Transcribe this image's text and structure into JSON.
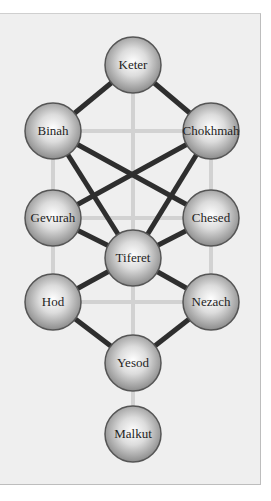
{
  "colors": {
    "panel_bg": "#efefef",
    "light_path": "#d2d2d2",
    "dark_path": "#2e2e2e",
    "node_outline": "#555555"
  },
  "nodes": [
    {
      "id": "keter",
      "label": "Keter",
      "x": 133,
      "y": 65
    },
    {
      "id": "binah",
      "label": "Binah",
      "x": 53,
      "y": 131
    },
    {
      "id": "chokhmah",
      "label": "Chokhmah",
      "x": 211,
      "y": 131
    },
    {
      "id": "gevurah",
      "label": "Gevurah",
      "x": 53,
      "y": 218
    },
    {
      "id": "chesed",
      "label": "Chesed",
      "x": 211,
      "y": 218
    },
    {
      "id": "tiferet",
      "label": "Tiferet",
      "x": 133,
      "y": 258
    },
    {
      "id": "hod",
      "label": "Hod",
      "x": 53,
      "y": 302
    },
    {
      "id": "nezach",
      "label": "Nezach",
      "x": 211,
      "y": 302
    },
    {
      "id": "yesod",
      "label": "Yesod",
      "x": 133,
      "y": 363
    },
    {
      "id": "malkut",
      "label": "Malkut",
      "x": 133,
      "y": 434
    }
  ],
  "light_paths": [
    [
      "keter",
      "yesod"
    ],
    [
      "yesod",
      "malkut"
    ],
    [
      "binah",
      "hod"
    ],
    [
      "chokhmah",
      "nezach"
    ],
    [
      "binah",
      "chokhmah"
    ],
    [
      "gevurah",
      "chesed"
    ],
    [
      "hod",
      "nezach"
    ]
  ],
  "dark_paths": [
    [
      "keter",
      "binah"
    ],
    [
      "keter",
      "chokhmah"
    ],
    [
      "binah",
      "chesed"
    ],
    [
      "binah",
      "tiferet"
    ],
    [
      "chokhmah",
      "gevurah"
    ],
    [
      "chokhmah",
      "tiferet"
    ],
    [
      "gevurah",
      "tiferet"
    ],
    [
      "chesed",
      "tiferet"
    ],
    [
      "tiferet",
      "hod"
    ],
    [
      "tiferet",
      "nezach"
    ],
    [
      "hod",
      "yesod"
    ],
    [
      "nezach",
      "yesod"
    ]
  ],
  "node_radius": 28
}
